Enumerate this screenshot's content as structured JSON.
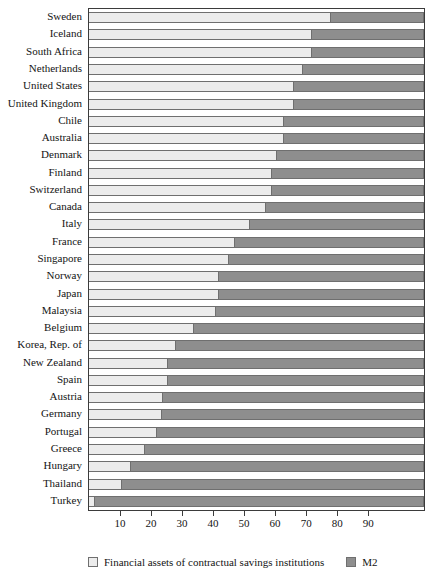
{
  "chart_data": {
    "type": "bar",
    "orientation": "horizontal",
    "stacked": true,
    "title": "",
    "xlabel": "",
    "ylabel": "",
    "xlim": [
      0,
      108
    ],
    "grid": false,
    "legend_position": "bottom",
    "xticks": [
      10,
      20,
      30,
      40,
      50,
      60,
      70,
      80,
      90
    ],
    "categories": [
      "Sweden",
      "Iceland",
      "South Africa",
      "Netherlands",
      "United States",
      "United Kingdom",
      "Chile",
      "Australia",
      "Denmark",
      "Finland",
      "Switzerland",
      "Canada",
      "Italy",
      "France",
      "Singapore",
      "Norway",
      "Japan",
      "Malaysia",
      "Belgium",
      "Korea, Rep. of",
      "New Zealand",
      "Spain",
      "Austria",
      "Germany",
      "Portugal",
      "Greece",
      "Hungary",
      "Thailand",
      "Turkey"
    ],
    "series": [
      {
        "name": "Financial assets of contractual savings institutions",
        "color": "#ececec",
        "values": [
          78,
          72,
          72,
          69,
          66,
          66,
          63,
          63,
          60.5,
          59,
          59,
          57,
          52,
          47,
          45,
          42,
          42,
          41,
          34,
          28,
          25.5,
          25.5,
          24,
          23.5,
          22,
          18,
          13.5,
          10.5,
          2
        ]
      },
      {
        "name": "M2",
        "color": "#8e8e8e",
        "values": [
          30,
          36,
          36,
          39,
          42,
          42,
          45,
          45,
          47.5,
          49,
          49,
          51,
          56,
          61,
          63,
          66,
          66,
          67,
          74,
          80,
          82.5,
          82.5,
          84,
          84.5,
          86,
          90,
          94.5,
          97.5,
          106
        ]
      }
    ]
  },
  "legend": {
    "items": [
      {
        "label": "Financial assets of contractual savings institutions",
        "swatch": "light"
      },
      {
        "label": "M2",
        "swatch": "dark"
      }
    ]
  }
}
